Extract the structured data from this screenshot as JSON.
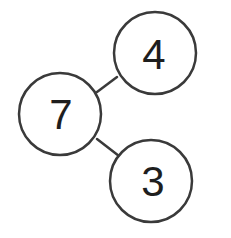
{
  "diagram": {
    "type": "number-bond",
    "whole": {
      "label": "7",
      "cx": 60,
      "cy": 114,
      "r": 41
    },
    "parts": [
      {
        "label": "4",
        "cx": 155,
        "cy": 53,
        "r": 41
      },
      {
        "label": "3",
        "cx": 151,
        "cy": 181,
        "r": 41
      }
    ],
    "connectors": [
      {
        "from": "whole",
        "to": "part-4",
        "x1": 97,
        "y1": 92,
        "x2": 117,
        "y2": 77
      },
      {
        "from": "whole",
        "to": "part-3",
        "x1": 97,
        "y1": 139,
        "x2": 119,
        "y2": 156
      }
    ],
    "colors": {
      "stroke": "#3a3a3a",
      "text": "#1e1e1e",
      "background": "#ffffff"
    }
  }
}
